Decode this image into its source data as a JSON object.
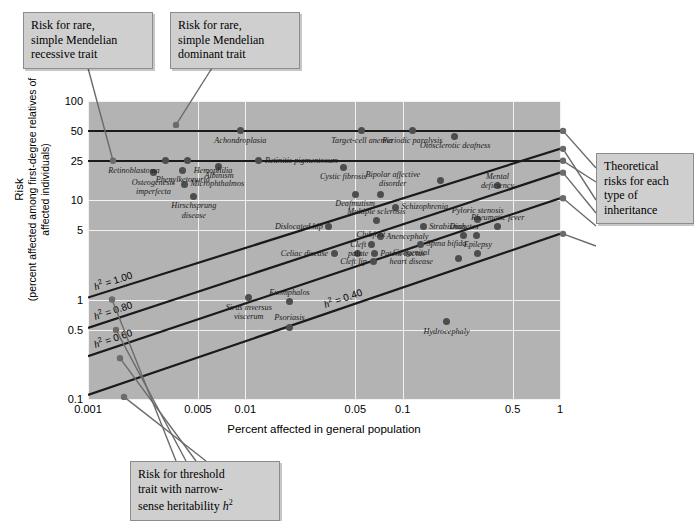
{
  "chart_data": {
    "type": "scatter",
    "title": "",
    "xlabel": "Percent affected in general population",
    "ylabel_line1": "Risk",
    "ylabel_line2": "(percent affected among first-degree relatives of affected individuals)",
    "xscale": "log",
    "yscale": "log",
    "xlim": [
      0.001,
      1
    ],
    "ylim": [
      0.1,
      100
    ],
    "xticks": [
      "0.001",
      "0.005",
      "0.01",
      "0.05",
      "0.1",
      "0.5",
      "1"
    ],
    "xtick_values": [
      0.001,
      0.005,
      0.01,
      0.05,
      0.1,
      0.5,
      1
    ],
    "yticks": [
      "100",
      "50",
      "25",
      "10",
      "5",
      "1",
      "0.5",
      "0.1"
    ],
    "ytick_values": [
      100,
      50,
      25,
      10,
      5,
      1,
      0.5,
      0.1
    ],
    "grid": true,
    "plot_background": "#b3b3b3",
    "gridline_color": "#f2f2f2",
    "point_color": "#4d4d4d",
    "line_color": "#1a1a1a",
    "mendelian_lines": [
      {
        "name": "dominant-trait-line",
        "risk_percent": 50,
        "label_ref": "Risk for rare, simple Mendelian dominant trait"
      },
      {
        "name": "recessive-trait-line",
        "risk_percent": 25,
        "label_ref": "Risk for rare, simple Mendelian recessive trait"
      }
    ],
    "heritability_lines": [
      {
        "label": "h² = 1.00",
        "h2": 1.0,
        "y_at_xmin": 1.05,
        "y_at_xmax": 33.0
      },
      {
        "label": "h² = 0.80",
        "h2": 0.8,
        "y_at_xmin": 0.52,
        "y_at_xmax": 19.0
      },
      {
        "label": "h² = 0.60",
        "h2": 0.6,
        "y_at_xmin": 0.27,
        "y_at_xmax": 10.5
      },
      {
        "label": "h² = 0.40",
        "h2": 0.4,
        "y_at_xmin": 0.11,
        "y_at_xmax": 4.6
      }
    ],
    "points": [
      {
        "name": "Achondroplasia",
        "x": 0.0093,
        "y": 50.0,
        "lx": "ctr",
        "ly": "below"
      },
      {
        "name": "Target-cell anemia",
        "x": 0.055,
        "y": 50.0,
        "lx": "ctr",
        "ly": "below"
      },
      {
        "name": "Periodic paralysis",
        "x": 0.115,
        "y": 50.0,
        "lx": "ctr",
        "ly": "below"
      },
      {
        "name": "Otosclerotic deafness",
        "x": 0.215,
        "y": 44.0,
        "lx": "ctr",
        "ly": "below"
      },
      {
        "name": "Retinoblastoma",
        "x": 0.0031,
        "y": 25.0,
        "lx": "left",
        "ly": "below"
      },
      {
        "name": "Hemophilia",
        "x": 0.0043,
        "y": 25.0,
        "lx": "right",
        "ly": "below"
      },
      {
        "name": "Albinism",
        "x": 0.0068,
        "y": 22.0,
        "lx": "ctr",
        "ly": "below"
      },
      {
        "name": "Retinitis pigmentosum",
        "x": 0.0122,
        "y": 25.0,
        "lx": "right",
        "ly": "mid"
      },
      {
        "name": "Phenylketonuria",
        "x": 0.004,
        "y": 20.0,
        "lx": "ctr",
        "ly": "below"
      },
      {
        "name": "Osteogenesis imperfecta",
        "x": 0.0026,
        "y": 19.0,
        "lx": "ctr",
        "ly": "below"
      },
      {
        "name": "Cystic fibrosis",
        "x": 0.042,
        "y": 21.5,
        "lx": "ctr",
        "ly": "below"
      },
      {
        "name": "Bipolar affective disorder",
        "x": 0.175,
        "y": 16.0,
        "lx": "left",
        "ly": "mid"
      },
      {
        "name": "Mental deficiency",
        "x": 0.4,
        "y": 14.0,
        "lx": "ctr",
        "ly": "above"
      },
      {
        "name": "Microphthalmos",
        "x": 0.0041,
        "y": 14.5,
        "lx": "right",
        "ly": "mid"
      },
      {
        "name": "Deafmutism",
        "x": 0.05,
        "y": 11.5,
        "lx": "ctr",
        "ly": "below"
      },
      {
        "name": "Deafmutism-2",
        "x": 0.072,
        "y": 11.5,
        "lx": "none",
        "ly": "none"
      },
      {
        "name": "Hirschsprung disease",
        "x": 0.0047,
        "y": 11.0,
        "lx": "ctr",
        "ly": "below"
      },
      {
        "name": "Schizophrenia",
        "x": 0.09,
        "y": 8.5,
        "lx": "right",
        "ly": "mid"
      },
      {
        "name": "Multiple sclerosis",
        "x": 0.068,
        "y": 6.2,
        "lx": "ctr",
        "ly": "above"
      },
      {
        "name": "Pyloric stenosis",
        "x": 0.3,
        "y": 6.4,
        "lx": "ctr",
        "ly": "above"
      },
      {
        "name": "Dislocated hip",
        "x": 0.034,
        "y": 5.4,
        "lx": "left",
        "ly": "mid"
      },
      {
        "name": "Strabismus",
        "x": 0.135,
        "y": 5.4,
        "lx": "right",
        "ly": "mid"
      },
      {
        "name": "Rheumatic fever",
        "x": 0.4,
        "y": 5.4,
        "lx": "ctr",
        "ly": "above"
      },
      {
        "name": "Anencephaly",
        "x": 0.072,
        "y": 4.3,
        "lx": "right",
        "ly": "mid"
      },
      {
        "name": "Diabetes",
        "x": 0.245,
        "y": 4.4,
        "lx": "ctr",
        "ly": "above"
      },
      {
        "name": "Diabetes-2",
        "x": 0.295,
        "y": 4.4,
        "lx": "none",
        "ly": "none"
      },
      {
        "name": "Spina bifida",
        "x": 0.13,
        "y": 3.6,
        "lx": "right",
        "ly": "mid"
      },
      {
        "name": "Clubfoot",
        "x": 0.063,
        "y": 3.6,
        "lx": "ctr",
        "ly": "above"
      },
      {
        "name": "Cleft palate",
        "x": 0.052,
        "y": 2.9,
        "lx": "ctr",
        "ly": "above"
      },
      {
        "name": "Patent ductus",
        "x": 0.066,
        "y": 2.9,
        "lx": "right",
        "ly": "mid"
      },
      {
        "name": "Celiac disease",
        "x": 0.037,
        "y": 2.9,
        "lx": "left",
        "ly": "mid"
      },
      {
        "name": "Epilepsy",
        "x": 0.3,
        "y": 2.9,
        "lx": "ctr",
        "ly": "above"
      },
      {
        "name": "Congenital heart disease",
        "x": 0.225,
        "y": 2.6,
        "lx": "left",
        "ly": "mid"
      },
      {
        "name": "Cleft lip",
        "x": 0.065,
        "y": 2.4,
        "lx": "left",
        "ly": "mid"
      },
      {
        "name": "Sirus inversus viscerum",
        "x": 0.0105,
        "y": 1.05,
        "lx": "ctr",
        "ly": "below"
      },
      {
        "name": "Exomphalos",
        "x": 0.019,
        "y": 0.95,
        "lx": "ctr",
        "ly": "above"
      },
      {
        "name": "Psoriasis",
        "x": 0.019,
        "y": 0.53,
        "lx": "ctr",
        "ly": "above"
      },
      {
        "name": "Hydrocephaly",
        "x": 0.19,
        "y": 0.6,
        "lx": "ctr",
        "ly": "below"
      }
    ]
  },
  "callouts": {
    "recessive": {
      "name": "callout-recessive",
      "lines": [
        "Risk for rare,",
        "simple Mendelian",
        "recessive trait"
      ]
    },
    "dominant": {
      "name": "callout-dominant",
      "lines": [
        "Risk for rare,",
        "simple Mendelian",
        "dominant trait"
      ]
    },
    "theoretical": {
      "name": "callout-theoretical",
      "lines": [
        "Theoretical",
        "risks for each",
        "type of",
        "inheritance"
      ]
    },
    "threshold": {
      "name": "callout-threshold",
      "line1": "Risk for threshold",
      "line2": "trait with narrow-",
      "line3_pre": "sense heritability ",
      "line3_italic": "h",
      "line3_sup": "2"
    }
  },
  "h2_labels": {
    "l100": {
      "pre": "h",
      "sup": "2",
      "post": " = 1.00"
    },
    "l080": {
      "pre": "h",
      "sup": "2",
      "post": " = 0.80"
    },
    "l060": {
      "pre": "h",
      "sup": "2",
      "post": " = 0.60"
    },
    "l040": {
      "pre": "h",
      "sup": "2",
      "post": " = 0.40"
    }
  }
}
